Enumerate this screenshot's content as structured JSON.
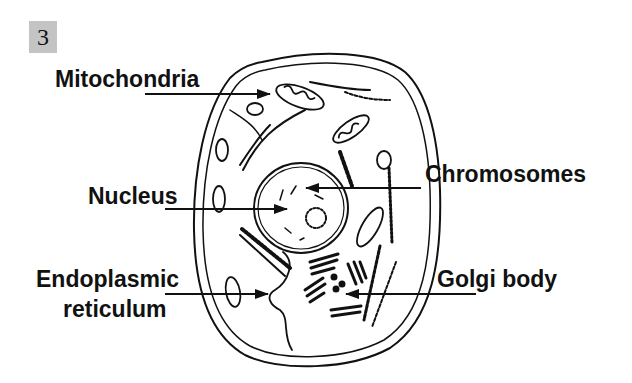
{
  "figure": {
    "number": "3",
    "type": "labeled diagram"
  },
  "labels": {
    "mitochondria": "Mitochondria",
    "nucleus": "Nucleus",
    "endoplasmic_line1": "Endoplasmic",
    "endoplasmic_line2": "reticulum",
    "chromosomes": "Chromosomes",
    "golgi": "Golgi body"
  },
  "colors": {
    "ink": "#111111",
    "badge_bg": "#c4c4c4",
    "background": "#ffffff"
  }
}
